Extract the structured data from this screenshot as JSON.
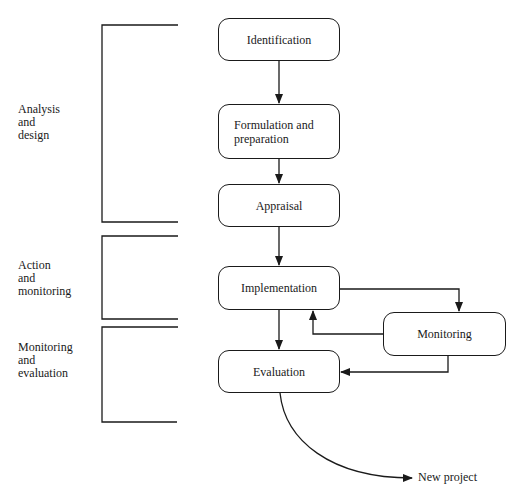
{
  "diagram": {
    "type": "flowchart",
    "phases": [
      {
        "id": "analysis",
        "label_lines": [
          "Analysis",
          "and",
          "design"
        ]
      },
      {
        "id": "action",
        "label_lines": [
          "Action",
          "and",
          "monitoring"
        ]
      },
      {
        "id": "monitoring-eval",
        "label_lines": [
          "Monitoring",
          "and",
          "evaluation"
        ]
      }
    ],
    "nodes": [
      {
        "id": "identification",
        "label": "Identification"
      },
      {
        "id": "formulation",
        "label_lines": [
          "Formulation and",
          "preparation"
        ]
      },
      {
        "id": "appraisal",
        "label": "Appraisal"
      },
      {
        "id": "implementation",
        "label": "Implementation"
      },
      {
        "id": "monitoring",
        "label": "Monitoring"
      },
      {
        "id": "evaluation",
        "label": "Evaluation"
      }
    ],
    "edges": [
      {
        "from": "identification",
        "to": "formulation"
      },
      {
        "from": "formulation",
        "to": "appraisal"
      },
      {
        "from": "appraisal",
        "to": "implementation"
      },
      {
        "from": "implementation",
        "to": "monitoring"
      },
      {
        "from": "monitoring",
        "to": "implementation"
      },
      {
        "from": "implementation",
        "to": "evaluation"
      },
      {
        "from": "monitoring",
        "to": "evaluation"
      },
      {
        "from": "evaluation",
        "to": "new-project"
      }
    ],
    "output_label": "New project"
  }
}
